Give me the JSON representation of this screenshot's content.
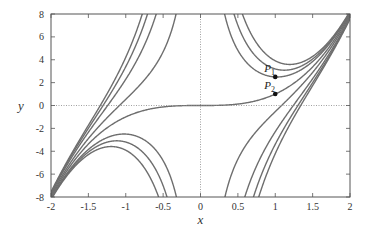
{
  "chart_data": {
    "type": "line",
    "title": "",
    "xlabel": "x",
    "ylabel": "y",
    "xlim": [
      -2,
      2
    ],
    "ylim": [
      -8,
      8
    ],
    "grid": false,
    "legend": null,
    "x_ticks": [
      -2,
      -1.5,
      -1,
      -0.5,
      0,
      0.5,
      1,
      1.5,
      2
    ],
    "x_tick_labels": [
      "-2",
      "-1.5",
      "-1",
      "-0.5",
      "0",
      "0.5",
      "1",
      "1.5",
      "2"
    ],
    "y_ticks": [
      -8,
      -6,
      -4,
      -2,
      0,
      2,
      4,
      6,
      8
    ],
    "y_tick_labels": [
      "-8",
      "-6",
      "-4",
      "-2",
      "0",
      "2",
      "4",
      "6",
      "8"
    ],
    "reference_lines": [
      {
        "orientation": "horizontal",
        "value": 0,
        "style": "dotted"
      },
      {
        "orientation": "vertical",
        "value": 0,
        "style": "dotted"
      }
    ],
    "family_description": "Solution curves y = x^3 + c*h(x), h odd and singular at x = 0 (approximated as h(x)=exp(-0.6x^2)/x)",
    "particular_solution": {
      "name": "y = x^3",
      "passes_through": "P2"
    },
    "curve_parameters_c": [
      5.3,
      4.0,
      2.73,
      -2.8,
      -6.0,
      -8.0,
      -9.5
    ],
    "series_color": "#6e6e6e",
    "points": [
      {
        "label": "P",
        "subscript": "1",
        "x": 1,
        "y": 2.5
      },
      {
        "label": "P",
        "subscript": "2",
        "x": 1,
        "y": 1
      }
    ],
    "approx_local_extrema": [
      {
        "x": 0.86,
        "y": 2.5,
        "type": "min"
      },
      {
        "x": 0.95,
        "y": 3.2,
        "type": "min"
      },
      {
        "x": 1.0,
        "y": 4.0,
        "type": "min"
      },
      {
        "x": -1.07,
        "y": -2.5,
        "type": "max"
      },
      {
        "x": -1.1,
        "y": -4.1,
        "type": "max"
      },
      {
        "x": -1.2,
        "y": -5.0,
        "type": "max"
      }
    ]
  },
  "plot_area": {
    "left": 51,
    "top": 14,
    "right": 350,
    "bottom": 197
  }
}
